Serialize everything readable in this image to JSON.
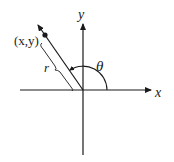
{
  "diagram": {
    "labels": {
      "x_axis": "x",
      "y_axis": "y",
      "point": "(x,y)",
      "radius": "r",
      "angle": "θ"
    },
    "colors": {
      "stroke": "#1a1a1a",
      "background": "#ffffff"
    }
  }
}
